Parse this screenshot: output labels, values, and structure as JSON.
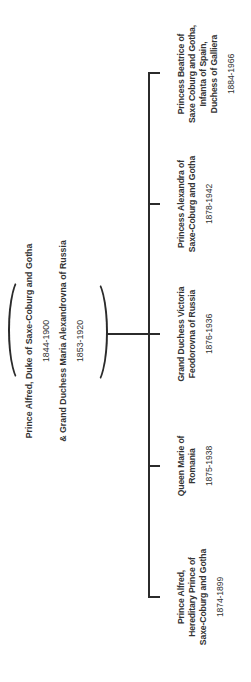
{
  "diagram_type": "family-tree",
  "parents": {
    "father": {
      "name": "Prince Alfred, Duke of Saxe-Coburg and Gotha",
      "years": "1844-1900"
    },
    "mother": {
      "name": "& Grand Duchess Maria Alexandrovna of Russia",
      "years": "1853-1920"
    }
  },
  "children": [
    {
      "line1": "Prince Alfred,",
      "line2": "Hereditary Prince of",
      "line3": "Saxe-Coburg and Gotha",
      "line4": "",
      "years": "1874-1899"
    },
    {
      "line1": "Queen Marie of",
      "line2": "Romania",
      "line3": "",
      "line4": "",
      "years": "1875-1938"
    },
    {
      "line1": "Grand Duchess Victoria",
      "line2": "Feodorovna of Russia",
      "line3": "",
      "line4": "",
      "years": "1876-1936"
    },
    {
      "line1": "Princess Alexandra of",
      "line2": "Saxe-Coburg and Gotha",
      "line3": "",
      "line4": "",
      "years": "1878-1942"
    },
    {
      "line1": "Princess Beatrice of",
      "line2": "Saxe Coburg and Gotha,",
      "line3": "Infanta of Spain,",
      "line4": "Duchess of Galliera",
      "years": "1884-1966"
    }
  ],
  "colors": {
    "line": "#2b2b2b",
    "text": "#333333",
    "background": "#ffffff"
  }
}
